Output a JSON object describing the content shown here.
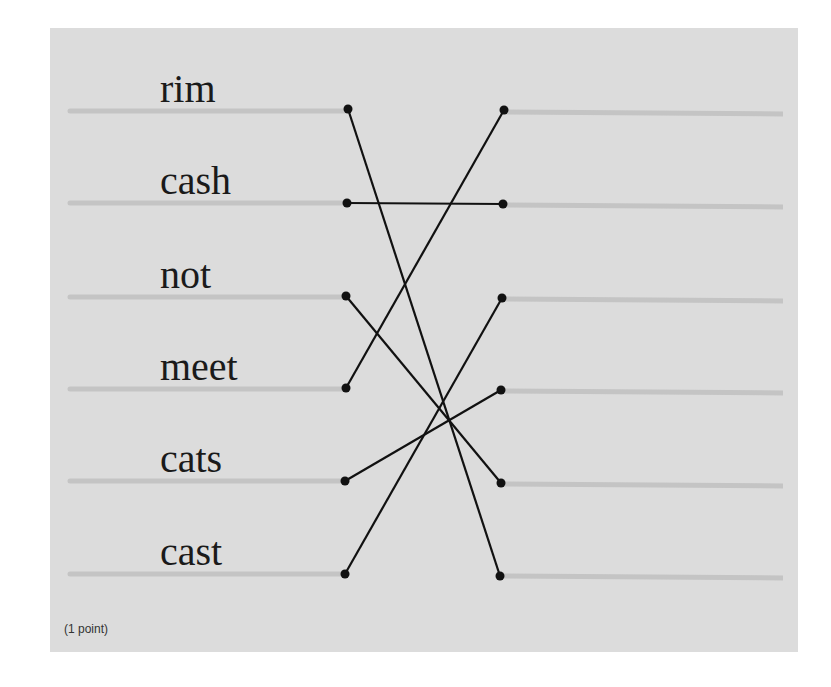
{
  "question": {
    "points_label": "(1 point)",
    "left_items": [
      {
        "label": "rim",
        "y": 111
      },
      {
        "label": "cash",
        "y": 203
      },
      {
        "label": "not",
        "y": 297
      },
      {
        "label": "meet",
        "y": 389
      },
      {
        "label": "cats",
        "y": 481
      },
      {
        "label": "cast",
        "y": 574
      }
    ],
    "right_slots": [
      {
        "index": 1,
        "y": 111
      },
      {
        "index": 2,
        "y": 205
      },
      {
        "index": 3,
        "y": 299
      },
      {
        "index": 4,
        "y": 391
      },
      {
        "index": 5,
        "y": 484
      },
      {
        "index": 6,
        "y": 576
      }
    ],
    "connections": [
      {
        "from": "rim",
        "to_slot": 6
      },
      {
        "from": "cash",
        "to_slot": 2
      },
      {
        "from": "not",
        "to_slot": 5
      },
      {
        "from": "meet",
        "to_slot": 1
      },
      {
        "from": "cats",
        "to_slot": 4
      },
      {
        "from": "cast",
        "to_slot": 3
      }
    ]
  },
  "colors": {
    "panel_bg": "#dcdcdc",
    "guide_line": "#c4c4c4",
    "connector": "#111111",
    "text": "#1a1a1a"
  }
}
